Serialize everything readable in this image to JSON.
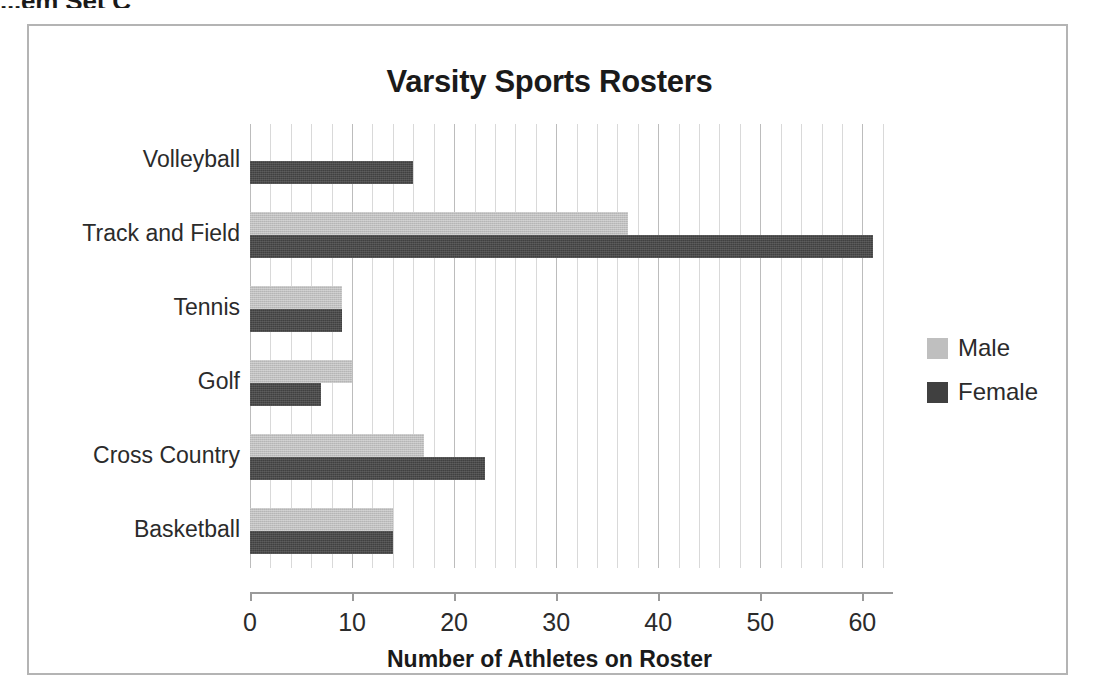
{
  "page": {
    "cropped_heading": "...em Set C"
  },
  "chart_data": {
    "type": "bar",
    "orientation": "horizontal",
    "title": "Varsity Sports Rosters",
    "xlabel": "Number of Athletes on Roster",
    "ylabel": "",
    "categories": [
      "Volleyball",
      "Track and Field",
      "Tennis",
      "Golf",
      "Cross Country",
      "Basketball"
    ],
    "series": [
      {
        "name": "Male",
        "color": "#BFBFBF",
        "values": [
          null,
          37,
          9,
          10,
          17,
          14
        ]
      },
      {
        "name": "Female",
        "color": "#404040",
        "values": [
          16,
          61,
          9,
          7,
          23,
          14
        ]
      }
    ],
    "xticks": [
      0,
      10,
      20,
      30,
      40,
      50,
      60
    ],
    "xlim": [
      0,
      63
    ],
    "minor_gridline_step": 2,
    "grid": true,
    "legend_position": "right"
  },
  "legend": {
    "entries": [
      {
        "label": "Male",
        "color": "#BFBFBF"
      },
      {
        "label": "Female",
        "color": "#404040"
      }
    ]
  }
}
